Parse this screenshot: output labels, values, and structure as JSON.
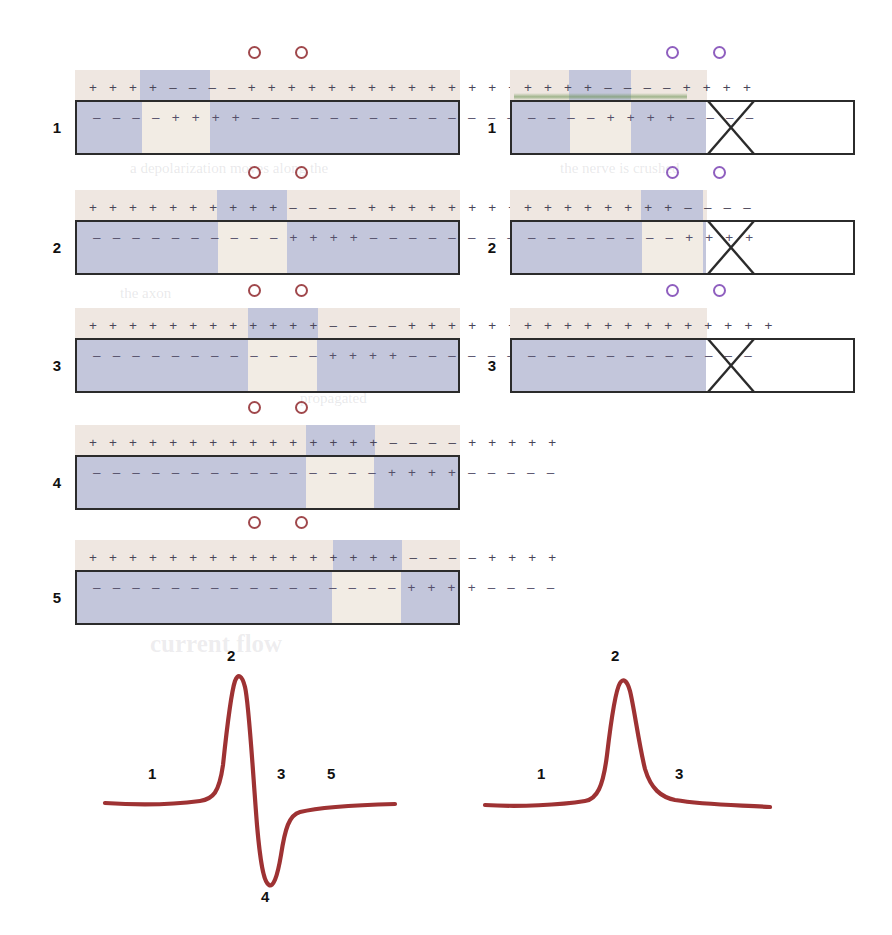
{
  "figure": {
    "colors": {
      "polarized_outside": "#efe7e1",
      "polarized_inside": "#c3c6db",
      "depolarized_outside": "#c3c6db",
      "depolarized_inside": "#f2ece4",
      "axon_border": "#2b2b2b",
      "trace": "#9e3233",
      "electrode_left": "#a0484c",
      "electrode_right": "#8f5fbf",
      "charge_text": "#4a4658",
      "membrane_green": "#608c46"
    },
    "glyphs": {
      "plus": "+",
      "minus": "–",
      "electrode": "○"
    }
  },
  "left_column": {
    "name": "intact-nerve-biphasic",
    "electrodes": [
      {
        "label": "proximal-recording-electrode"
      },
      {
        "label": "distal-recording-electrode"
      }
    ],
    "panels": [
      {
        "number": "1",
        "outside_charges": [
          "+ + + +",
          "– – – –",
          "+ + + + + + + + + + + + + + +"
        ],
        "inside_charges": [
          "– – – –",
          "+ + + +",
          "– – – – – – – – – – – – – – –"
        ],
        "depolarized_start_pct": 17,
        "depolarized_end_pct": 35,
        "cut": false
      },
      {
        "number": "2",
        "outside_charges": [
          "+ + + + + + + + + +",
          "– – – –",
          "+ + + + + + + + +"
        ],
        "inside_charges": [
          "– – – – – – – – – –",
          "+ + + +",
          "– – – – – – – – –"
        ],
        "depolarized_start_pct": 37,
        "depolarized_end_pct": 55,
        "cut": false
      },
      {
        "number": "3",
        "outside_charges": [
          "+ + + + + + + + + + + +",
          "– – – –",
          "+ + + + + + + +"
        ],
        "inside_charges": [
          "– – – – – – – – – – – –",
          "+ + + +",
          "– – – – – – – –"
        ],
        "depolarized_start_pct": 45,
        "depolarized_end_pct": 63,
        "cut": false
      },
      {
        "number": "4",
        "outside_charges": [
          "+ + + + + + + + + + + + + + +",
          "– – – –",
          "+ + + + +"
        ],
        "inside_charges": [
          "– – – – – – – – – – – – – – –",
          "+ + + +",
          "– – – – –"
        ],
        "depolarized_start_pct": 60,
        "depolarized_end_pct": 78,
        "cut": false
      },
      {
        "number": "5",
        "outside_charges": [
          "+ + + + + + + + + + + + + + + +",
          "– – – –",
          "+ + + +"
        ],
        "inside_charges": [
          "– – – – – – – – – – – – – – – –",
          "+ + + +",
          "– – – –"
        ],
        "depolarized_start_pct": 67,
        "depolarized_end_pct": 85,
        "cut": false
      }
    ]
  },
  "right_column": {
    "name": "crushed-nerve-monophasic",
    "electrodes": [
      {
        "label": "proximal-recording-electrode"
      },
      {
        "label": "distal-recording-electrode-over-crush"
      }
    ],
    "panels": [
      {
        "number": "1",
        "outside_charges": [
          "+ + + +",
          "– – – –",
          "+ + + +"
        ],
        "inside_charges": [
          "– – – –",
          "+ + + +",
          "– – – –"
        ],
        "depolarized_start_pct": 17,
        "depolarized_end_pct": 35,
        "cut": true,
        "membrane_tint": true
      },
      {
        "number": "2",
        "outside_charges": [
          "+ + + + + + + +",
          "– – – –",
          ""
        ],
        "inside_charges": [
          "– – – – – – – –",
          "+ + + +",
          ""
        ],
        "depolarized_start_pct": 38,
        "depolarized_end_pct": 56,
        "cut": true,
        "membrane_tint": false
      },
      {
        "number": "3",
        "outside_charges": [
          "+ + + + + + + + + + + + +",
          "",
          ""
        ],
        "inside_charges": [
          "– – – – – – – – – – – –",
          "",
          ""
        ],
        "depolarized_start_pct": 0,
        "depolarized_end_pct": 0,
        "cut": true,
        "membrane_tint": false
      }
    ]
  },
  "traces": {
    "biphasic": {
      "name": "biphasic-action-potential-trace",
      "labels": [
        "1",
        "2",
        "3",
        "4",
        "5"
      ],
      "description": "Biphasic recording from intact nerve"
    },
    "monophasic": {
      "name": "monophasic-action-potential-trace",
      "labels": [
        "1",
        "2",
        "3"
      ],
      "description": "Monophasic recording from crushed nerve"
    }
  },
  "chart_data": [
    {
      "type": "line",
      "name": "biphasic",
      "title": "",
      "xlabel": "",
      "ylabel": "",
      "annotations": [
        "1",
        "2",
        "3",
        "4",
        "5"
      ],
      "x": [
        0,
        12,
        24,
        33,
        38,
        41,
        44,
        47,
        50,
        53,
        56,
        59,
        63,
        70,
        80,
        90,
        100
      ],
      "y": [
        0,
        0,
        0.02,
        0.1,
        0.35,
        0.85,
        1.0,
        0.7,
        0.05,
        -0.55,
        -0.92,
        -0.4,
        -0.1,
        -0.03,
        0.0,
        0.01,
        0.01
      ],
      "ylim": [
        -1.05,
        1.1
      ],
      "grid": false,
      "legend": "none"
    },
    {
      "type": "line",
      "name": "monophasic",
      "title": "",
      "xlabel": "",
      "ylabel": "",
      "annotations": [
        "1",
        "2",
        "3"
      ],
      "x": [
        0,
        15,
        30,
        38,
        43,
        47,
        50,
        54,
        58,
        64,
        72,
        82,
        92,
        100
      ],
      "y": [
        0,
        0.01,
        0.03,
        0.1,
        0.5,
        0.92,
        1.0,
        0.72,
        0.38,
        0.17,
        0.08,
        0.04,
        0.01,
        0.0
      ],
      "ylim": [
        -0.1,
        1.1
      ],
      "grid": false,
      "legend": "none"
    }
  ],
  "ghost_text": {
    "lines": [
      "a depolarization moves along the",
      "record a",
      "the axon",
      "propagated",
      "regionas",
      "the nerve is crushed",
      "current flow"
    ]
  }
}
